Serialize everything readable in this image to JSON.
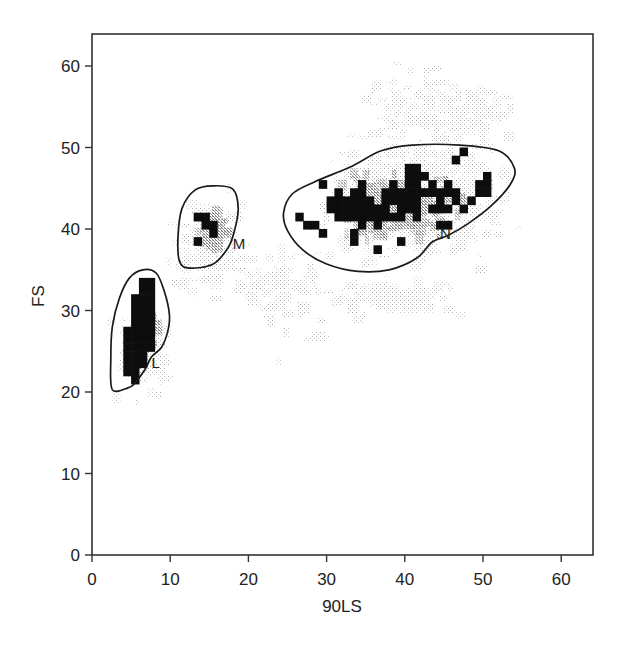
{
  "chart_data": {
    "type": "heatmap",
    "subtype": "flow-cytometry density dot plot with gates",
    "title": "",
    "xlabel": "90LS",
    "ylabel": "FS",
    "xlim": [
      0,
      64
    ],
    "ylim": [
      0,
      64
    ],
    "xticks": [
      0,
      10,
      20,
      30,
      40,
      50,
      60
    ],
    "yticks": [
      0,
      10,
      20,
      30,
      40,
      50,
      60
    ],
    "grid": false,
    "legend": null,
    "gates": [
      {
        "label": "L",
        "label_pos": [
          7.6,
          23.0
        ],
        "polygon": [
          [
            2.6,
            20.3
          ],
          [
            2.4,
            24
          ],
          [
            2.6,
            28
          ],
          [
            3.5,
            31.5
          ],
          [
            4.8,
            34
          ],
          [
            6.5,
            35
          ],
          [
            8.2,
            34.6
          ],
          [
            9.2,
            32.5
          ],
          [
            9.9,
            29.5
          ],
          [
            9.7,
            27.5
          ],
          [
            8.9,
            25.5
          ],
          [
            7.6,
            24.3
          ],
          [
            6.8,
            22.8
          ],
          [
            5.4,
            21.0
          ],
          [
            4.6,
            20.5
          ]
        ],
        "population_center": [
          5.5,
          27.5
        ]
      },
      {
        "label": "M",
        "label_pos": [
          18.0,
          37.5
        ],
        "polygon": [
          [
            11.2,
            36.0
          ],
          [
            11.0,
            39
          ],
          [
            11.5,
            42.5
          ],
          [
            13.2,
            44.8
          ],
          [
            15.5,
            45.3
          ],
          [
            18.0,
            44.9
          ],
          [
            18.7,
            42.5
          ],
          [
            18.2,
            39.7
          ],
          [
            17.4,
            37.7
          ],
          [
            15.5,
            35.7
          ],
          [
            12.5,
            35.2
          ]
        ],
        "population_center": [
          14.5,
          40.5
        ]
      },
      {
        "label": "N",
        "label_pos": [
          44.5,
          38.8
        ],
        "polygon": [
          [
            24.5,
            42.0
          ],
          [
            25.0,
            39.8
          ],
          [
            27.0,
            37.4
          ],
          [
            30.0,
            35.7
          ],
          [
            34.0,
            34.8
          ],
          [
            38.0,
            35.0
          ],
          [
            41.5,
            36.4
          ],
          [
            43.5,
            38.4
          ],
          [
            45.5,
            39.2
          ],
          [
            48.0,
            40.6
          ],
          [
            51.0,
            42.8
          ],
          [
            53.5,
            45.5
          ],
          [
            54.0,
            47.5
          ],
          [
            52.0,
            49.6
          ],
          [
            47.0,
            50.3
          ],
          [
            41.0,
            50.3
          ],
          [
            37.0,
            49.6
          ],
          [
            33.0,
            47.6
          ],
          [
            28.5,
            45.8
          ],
          [
            25.6,
            44.3
          ]
        ],
        "population_center": [
          38.0,
          43.0
        ]
      }
    ],
    "density_levels": [
      "low (light stipple)",
      "medium (gray)",
      "high (black)"
    ],
    "high_density_cells": [
      [
        4,
        22
      ],
      [
        4,
        23
      ],
      [
        4,
        24
      ],
      [
        4,
        25
      ],
      [
        4,
        26
      ],
      [
        4,
        27
      ],
      [
        5,
        21
      ],
      [
        5,
        22
      ],
      [
        5,
        23
      ],
      [
        5,
        24
      ],
      [
        5,
        25
      ],
      [
        5,
        26
      ],
      [
        5,
        27
      ],
      [
        5,
        28
      ],
      [
        5,
        29
      ],
      [
        5,
        30
      ],
      [
        6,
        23
      ],
      [
        6,
        24
      ],
      [
        6,
        25
      ],
      [
        6,
        26
      ],
      [
        6,
        27
      ],
      [
        6,
        28
      ],
      [
        6,
        29
      ],
      [
        6,
        30
      ],
      [
        6,
        31
      ],
      [
        6,
        32
      ],
      [
        7,
        25
      ],
      [
        7,
        26
      ],
      [
        7,
        27
      ],
      [
        7,
        28
      ],
      [
        7,
        29
      ],
      [
        7,
        30
      ],
      [
        7,
        31
      ],
      [
        7,
        32
      ],
      [
        7,
        33
      ],
      [
        5,
        31
      ],
      [
        6,
        33
      ],
      [
        13,
        41
      ],
      [
        14,
        41
      ],
      [
        14,
        40
      ],
      [
        15,
        40
      ],
      [
        15,
        39
      ],
      [
        13,
        38
      ],
      [
        29,
        45
      ],
      [
        30,
        43
      ],
      [
        30,
        42
      ],
      [
        31,
        44
      ],
      [
        31,
        43
      ],
      [
        31,
        42
      ],
      [
        31,
        41
      ],
      [
        32,
        43
      ],
      [
        32,
        42
      ],
      [
        32,
        41
      ],
      [
        33,
        44
      ],
      [
        33,
        43
      ],
      [
        33,
        42
      ],
      [
        33,
        41
      ],
      [
        34,
        45
      ],
      [
        34,
        44
      ],
      [
        34,
        43
      ],
      [
        34,
        42
      ],
      [
        34,
        41
      ],
      [
        34,
        40
      ],
      [
        35,
        43
      ],
      [
        35,
        42
      ],
      [
        35,
        41
      ],
      [
        36,
        42
      ],
      [
        36,
        41
      ],
      [
        36,
        40
      ],
      [
        37,
        44
      ],
      [
        37,
        43
      ],
      [
        37,
        42
      ],
      [
        37,
        41
      ],
      [
        38,
        45
      ],
      [
        38,
        44
      ],
      [
        38,
        43
      ],
      [
        38,
        41
      ],
      [
        39,
        44
      ],
      [
        39,
        43
      ],
      [
        39,
        42
      ],
      [
        39,
        41
      ],
      [
        40,
        47
      ],
      [
        40,
        46
      ],
      [
        40,
        45
      ],
      [
        40,
        44
      ],
      [
        40,
        43
      ],
      [
        40,
        42
      ],
      [
        41,
        47
      ],
      [
        41,
        46
      ],
      [
        41,
        45
      ],
      [
        41,
        44
      ],
      [
        41,
        43
      ],
      [
        41,
        42
      ],
      [
        41,
        41
      ],
      [
        42,
        46
      ],
      [
        42,
        44
      ],
      [
        43,
        45
      ],
      [
        43,
        44
      ],
      [
        43,
        42
      ],
      [
        44,
        44
      ],
      [
        44,
        43
      ],
      [
        44,
        42
      ],
      [
        45,
        45
      ],
      [
        45,
        44
      ],
      [
        45,
        42
      ],
      [
        46,
        44
      ],
      [
        46,
        43
      ],
      [
        46,
        48
      ],
      [
        47,
        42
      ],
      [
        47,
        49
      ],
      [
        49,
        45
      ],
      [
        49,
        44
      ],
      [
        48,
        43
      ],
      [
        50,
        46
      ],
      [
        50,
        45
      ],
      [
        50,
        44
      ],
      [
        26,
        41
      ],
      [
        27,
        40
      ],
      [
        28,
        40
      ],
      [
        29,
        39
      ],
      [
        33,
        39
      ],
      [
        36,
        37
      ],
      [
        39,
        38
      ],
      [
        44,
        40
      ],
      [
        45,
        40
      ],
      [
        33,
        38
      ]
    ]
  },
  "axes": {
    "x": {
      "label": "90LS",
      "ticks": [
        "0",
        "10",
        "20",
        "30",
        "40",
        "50",
        "60"
      ]
    },
    "y": {
      "label": "FS",
      "ticks": [
        "0",
        "10",
        "20",
        "30",
        "40",
        "50",
        "60"
      ]
    }
  },
  "colors": {
    "background": "#ffffff",
    "axis": "#333333",
    "gate_outline": "#1a1a1a",
    "high_density": "#0d0d0d",
    "medium_density": "#9a9a9a",
    "low_density": "#c8c8c8"
  }
}
